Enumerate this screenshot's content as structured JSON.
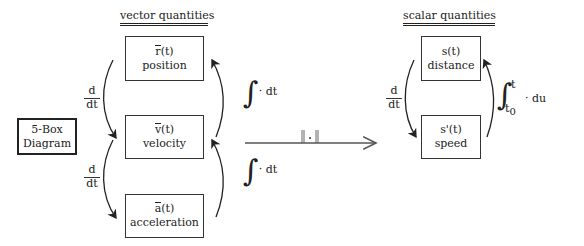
{
  "headings": {
    "vector": "vector quantities",
    "scalar": "scalar quantities"
  },
  "five_box": {
    "line1": "5-Box",
    "line2": "Diagram"
  },
  "vector_boxes": [
    {
      "symbol": "r",
      "arg": "(t)",
      "label": "position"
    },
    {
      "symbol": "v",
      "arg": "(t)",
      "label": "velocity"
    },
    {
      "symbol": "a",
      "arg": "(t)",
      "label": "acceleration"
    }
  ],
  "scalar_boxes": [
    {
      "symbol": "s",
      "arg": "(t)",
      "label": "distance"
    },
    {
      "symbol": "s'",
      "arg": "(t)",
      "label": "speed"
    }
  ],
  "derivative": {
    "num": "d",
    "den": "dt"
  },
  "integrals": {
    "vector_top": "· dt",
    "vector_bottom": "· dt",
    "scalar_upper_limit": "t",
    "scalar_lower_limit": "t",
    "scalar_lower_sub": "0",
    "scalar_tail": "· du"
  },
  "norm_arrow": {
    "label": "‖·‖"
  }
}
